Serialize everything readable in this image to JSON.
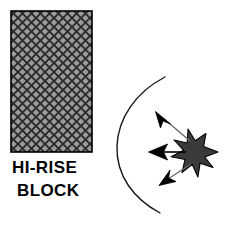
{
  "figure": {
    "background_color": "#ffffff",
    "width": 226,
    "height": 229
  },
  "block": {
    "label_line1": "HI-RISE",
    "label_line2": "BLOCK",
    "fill_color": "#9a9a9a",
    "hatch_color": "#2b2b2b",
    "border_color": "#000000",
    "x": 11,
    "y": 11,
    "width": 81,
    "height": 141,
    "hatch_pattern": "diagonal-cross-hatch",
    "hatch_pitch": 9
  },
  "blast_arc": {
    "name": "blast-wave-front",
    "stroke_color": "#1a1a1a",
    "stroke_width": 1.4,
    "start_x": 165,
    "start_y": 77,
    "end_x": 160,
    "end_y": 213,
    "leftmost_x": 117,
    "leftmost_y": 146
  },
  "burst": {
    "name": "explosion-burst",
    "center_x": 201,
    "center_y": 152,
    "outer_radius": 17,
    "inner_radius": 9,
    "points": 9,
    "fill_color": "#3a3a3a",
    "stroke_color": "#000000"
  },
  "arrows": [
    {
      "name": "blast-arrow-up-left",
      "direction": "up-left",
      "tail_x": 190,
      "tail_y": 141,
      "tip_x": 157,
      "tip_y": 113,
      "color": "#000000",
      "shaft_color": "#555555"
    },
    {
      "name": "blast-arrow-left",
      "direction": "left",
      "tail_x": 186,
      "tail_y": 152,
      "tip_x": 149,
      "tip_y": 152,
      "color": "#000000",
      "shaft_color": "#000000"
    },
    {
      "name": "blast-arrow-down-left",
      "direction": "down-left",
      "tail_x": 191,
      "tail_y": 164,
      "tip_x": 161,
      "tip_y": 185,
      "color": "#000000",
      "shaft_color": "#555555"
    }
  ],
  "text_labels": [
    {
      "id": "line1",
      "text": "HI-RISE",
      "x": 12,
      "y": 173
    },
    {
      "id": "line2",
      "text": "BLOCK",
      "x": 17,
      "y": 196
    }
  ]
}
